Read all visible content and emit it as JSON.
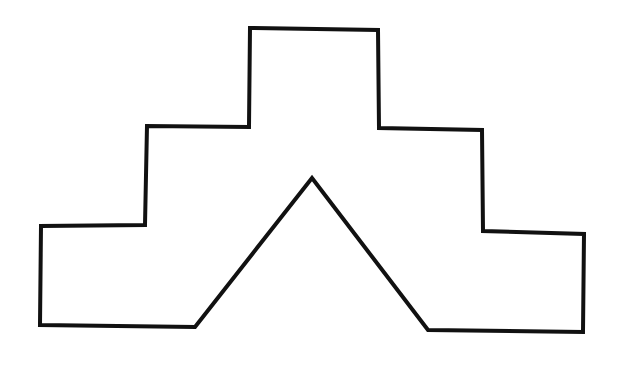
{
  "figure": {
    "background": "#ffffff",
    "stroke_color": "#111111",
    "stroke_width": 4,
    "shape": {
      "name": "stepped-pyramid-with-notch",
      "points": [
        [
          250,
          28
        ],
        [
          378,
          30
        ],
        [
          379,
          128
        ],
        [
          482,
          130
        ],
        [
          483,
          231
        ],
        [
          584,
          234
        ],
        [
          583,
          332
        ],
        [
          428,
          330
        ],
        [
          312,
          178
        ],
        [
          195,
          327
        ],
        [
          40,
          325
        ],
        [
          41,
          226
        ],
        [
          145,
          225
        ],
        [
          147,
          126
        ],
        [
          249,
          127
        ]
      ]
    }
  }
}
